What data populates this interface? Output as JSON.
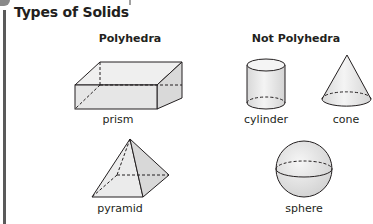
{
  "title": "Types of Solids",
  "groups": [
    {
      "heading": "Polyhedra",
      "items": [
        {
          "name": "prism",
          "label": "prism"
        },
        {
          "name": "pyramid",
          "label": "pyramid"
        }
      ]
    },
    {
      "heading": "Not Polyhedra",
      "items": [
        {
          "name": "cylinder",
          "label": "cylinder"
        },
        {
          "name": "cone",
          "label": "cone"
        },
        {
          "name": "sphere",
          "label": "sphere"
        }
      ]
    }
  ],
  "colors": {
    "stroke": "#231f20",
    "fill": "#ececec",
    "fill_dark": "#dcdcdc",
    "edge_bar": "#5a5a5a"
  }
}
